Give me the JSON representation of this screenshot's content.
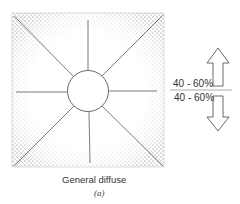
{
  "diagram": {
    "caption": "General diffuse",
    "sublabel": "(a)",
    "upward_label": "40 - 60%",
    "downward_label": "40 - 60%",
    "colors": {
      "stipple": "#555555",
      "line": "#444444",
      "background": "#ffffff"
    }
  }
}
